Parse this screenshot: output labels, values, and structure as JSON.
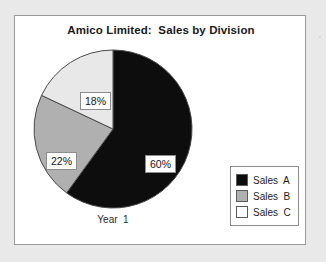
{
  "figure": {
    "background_color": "#e9e9e9",
    "panel_background_color": "#ffffff",
    "panel_border_color": "#9a9a9a"
  },
  "chart_data": {
    "type": "pie",
    "title": "Amico Limited:  Sales by Division",
    "category_label": "Year  1",
    "xlabel": "",
    "ylabel": "",
    "grid": false,
    "legend_position": "right-bottom",
    "start_angle_deg": 0,
    "direction": "clockwise",
    "labels": [
      "Sales A",
      "Sales B",
      "Sales C"
    ],
    "values": [
      60,
      22,
      18
    ],
    "value_labels": [
      "60%",
      "22%",
      "18%"
    ],
    "colors": [
      "#0d0d0d",
      "#b0b0b0",
      "#e8e8e8"
    ],
    "slice_edge_color": "#4a4a4a",
    "slices": [
      {
        "name": "Sales A",
        "value": 60,
        "value_label": "60%",
        "color": "#0d0d0d",
        "start_deg": 0,
        "end_deg": 216
      },
      {
        "name": "Sales B",
        "value": 22,
        "value_label": "22%",
        "color": "#b0b0b0",
        "start_deg": 216,
        "end_deg": 295.2
      },
      {
        "name": "Sales C",
        "value": 18,
        "value_label": "18%",
        "color": "#e8e8e8",
        "start_deg": 295.2,
        "end_deg": 360
      }
    ]
  },
  "legend": {
    "items": [
      {
        "label": "Sales  A",
        "color": "#0d0d0d"
      },
      {
        "label": "Sales  B",
        "color": "#b0b0b0"
      },
      {
        "label": "Sales  C",
        "color": "#fbfbfb"
      }
    ]
  }
}
